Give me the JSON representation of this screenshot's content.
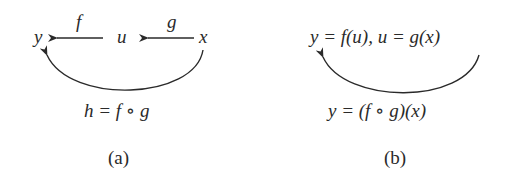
{
  "panel_a": {
    "y": "y",
    "u": "u",
    "x": "x",
    "f": "f",
    "g": "g",
    "composition": "h = f ∘ g",
    "caption": "(a)"
  },
  "panel_b": {
    "top_equation": "y = f(u), u = g(x)",
    "bottom_equation": "y = (f ∘ g)(x)",
    "caption": "(b)"
  },
  "colors": {
    "ink": "#2a2a2a",
    "background": "#ffffff"
  }
}
